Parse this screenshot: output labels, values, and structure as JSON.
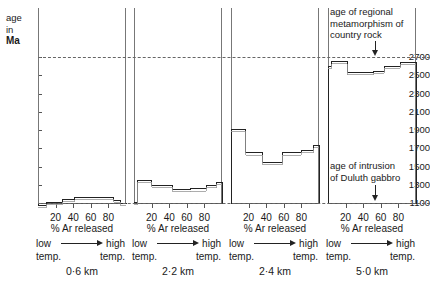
{
  "chart_data": {
    "type": "line",
    "title": "",
    "subtitle": "",
    "ylabel_lines": [
      "age",
      "in",
      "Ma"
    ],
    "ylabel": "age in Ma",
    "xlabel": "% Ar released",
    "ylim": [
      1000,
      2800
    ],
    "yticks": [
      1100,
      1300,
      1500,
      1700,
      1900,
      2100,
      2300,
      2500,
      2700
    ],
    "xticks": [
      20,
      40,
      60,
      80
    ],
    "xlim": [
      0,
      100
    ],
    "grid": false,
    "legend": "none",
    "reference_lines": [
      {
        "name": "age of regional metamorphism of country rock",
        "value": 2700,
        "style": "dashed"
      },
      {
        "name": "age of intrusion of Duluth gabbro",
        "value": 1100,
        "style": "dashed"
      }
    ],
    "annotations": [
      {
        "id": "metamorphism",
        "text_lines": [
          "age of regional",
          "metamorphism of",
          "country rock"
        ],
        "points_to": 2700
      },
      {
        "id": "intrusion",
        "text_lines": [
          "age of intrusion",
          "of Duluth gabbro"
        ],
        "points_to": 1100
      }
    ],
    "panels": [
      {
        "id": "panel-0-6km",
        "depth_label": "0·6 km",
        "xlabel": "% Ar released",
        "low_label_lines": [
          "low",
          "temp."
        ],
        "high_label_lines": [
          "high",
          "temp."
        ],
        "xticks": [
          20,
          40,
          60,
          80
        ],
        "steps": [
          {
            "x_start": 0,
            "x_end": 10,
            "age": 1075
          },
          {
            "x_start": 10,
            "x_end": 28,
            "age": 1110
          },
          {
            "x_start": 28,
            "x_end": 42,
            "age": 1140
          },
          {
            "x_start": 42,
            "x_end": 86,
            "age": 1160
          },
          {
            "x_start": 86,
            "x_end": 94,
            "age": 1130
          },
          {
            "x_start": 94,
            "x_end": 100,
            "age": 1095
          }
        ]
      },
      {
        "id": "panel-2-2km",
        "depth_label": "2·2 km",
        "xlabel": "% Ar released",
        "low_label_lines": [
          "low",
          "temp."
        ],
        "high_label_lines": [
          "high",
          "temp."
        ],
        "xticks": [
          20,
          40,
          60,
          80
        ],
        "steps": [
          {
            "x_start": 0,
            "x_end": 4,
            "age": 1105
          },
          {
            "x_start": 4,
            "x_end": 20,
            "age": 1350
          },
          {
            "x_start": 20,
            "x_end": 44,
            "age": 1295
          },
          {
            "x_start": 44,
            "x_end": 64,
            "age": 1250
          },
          {
            "x_start": 64,
            "x_end": 82,
            "age": 1255
          },
          {
            "x_start": 82,
            "x_end": 94,
            "age": 1290
          },
          {
            "x_start": 94,
            "x_end": 100,
            "age": 1330
          }
        ]
      },
      {
        "id": "panel-2-4km",
        "depth_label": "2·4 km",
        "xlabel": "% Ar released",
        "low_label_lines": [
          "low",
          "temp."
        ],
        "high_label_lines": [
          "high",
          "temp."
        ],
        "xticks": [
          20,
          40,
          60,
          80
        ],
        "steps": [
          {
            "x_start": 0,
            "x_end": 17,
            "age": 1905
          },
          {
            "x_start": 17,
            "x_end": 36,
            "age": 1650
          },
          {
            "x_start": 36,
            "x_end": 58,
            "age": 1545
          },
          {
            "x_start": 58,
            "x_end": 80,
            "age": 1650
          },
          {
            "x_start": 80,
            "x_end": 94,
            "age": 1675
          },
          {
            "x_start": 94,
            "x_end": 100,
            "age": 1730
          }
        ]
      },
      {
        "id": "panel-5-0km",
        "depth_label": "5·0 km",
        "xlabel": "% Ar released",
        "low_label_lines": [
          "low",
          "temp."
        ],
        "high_label_lines": [
          "high",
          "temp."
        ],
        "xticks": [
          20,
          40,
          60,
          80
        ],
        "steps": [
          {
            "x_start": 0,
            "x_end": 4,
            "age": 2600
          },
          {
            "x_start": 4,
            "x_end": 22,
            "age": 2650
          },
          {
            "x_start": 22,
            "x_end": 52,
            "age": 2530
          },
          {
            "x_start": 52,
            "x_end": 64,
            "age": 2545
          },
          {
            "x_start": 64,
            "x_end": 82,
            "age": 2600
          },
          {
            "x_start": 82,
            "x_end": 100,
            "age": 2640
          }
        ]
      }
    ]
  },
  "colors": {
    "axis": "#555555",
    "frame": "#777777",
    "dashed": "#666666",
    "step": "#222222",
    "background": "#ffffff"
  }
}
